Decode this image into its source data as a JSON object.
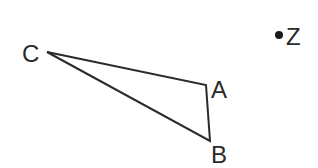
{
  "diagram": {
    "type": "geometry",
    "triangle": {
      "vertices": [
        {
          "id": "C",
          "label": "C",
          "x": 47,
          "y": 52,
          "label_x": 22,
          "label_y": 62
        },
        {
          "id": "A",
          "label": "A",
          "x": 206,
          "y": 85,
          "label_x": 211,
          "label_y": 98
        },
        {
          "id": "B",
          "label": "B",
          "x": 210,
          "y": 141,
          "label_x": 211,
          "label_y": 163
        }
      ],
      "edges": [
        [
          "C",
          "A"
        ],
        [
          "A",
          "B"
        ],
        [
          "B",
          "C"
        ]
      ]
    },
    "points": [
      {
        "id": "Z",
        "label": "Z",
        "x": 279,
        "y": 35,
        "radius": 4,
        "label_x": 286,
        "label_y": 45
      }
    ],
    "colors": {
      "stroke": "#2a2a2a",
      "text": "#2a2a2a",
      "point": "#1a1a1a",
      "background": "#ffffff"
    }
  }
}
